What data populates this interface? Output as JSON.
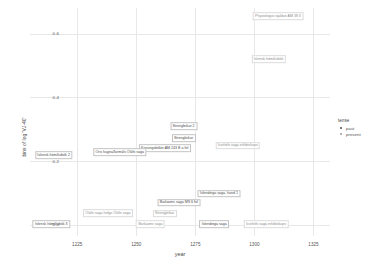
{
  "chart_data": {
    "type": "scatter",
    "title": "",
    "xlabel": "year",
    "ylabel": "bins of log 'VJ-40'",
    "xlim": [
      1205,
      1332
    ],
    "ylim": [
      -0.035,
      0.68
    ],
    "xticks": [
      1225,
      1250,
      1275,
      1300,
      1325
    ],
    "xtick_labels": [
      "1225",
      "1250",
      "1275",
      "1300",
      "1325"
    ],
    "yticks": [
      0.0,
      0.2,
      0.4,
      0.6
    ],
    "ytick_labels": [
      "0.0",
      "0.2",
      "0.4",
      "0.6"
    ],
    "grid": true,
    "legend": {
      "title": "tense",
      "position": "right",
      "entries": [
        {
          "label": "past",
          "color": "#4a4a4a",
          "marker": "circle"
        },
        {
          "label": "present",
          "color": "#9a9a9a",
          "marker": "circle"
        }
      ]
    },
    "points": [
      {
        "label": "Physiologus sjaldan AM 38 II",
        "x": 1310,
        "y": 0.655,
        "tense": "present"
      },
      {
        "label": "Íslensk hómilíubók",
        "x": 1306,
        "y": 0.52,
        "tense": "present"
      },
      {
        "label": "Strengleikar 2",
        "x": 1270,
        "y": 0.31,
        "tense": "past"
      },
      {
        "label": "Strengleikar",
        "x": 1270,
        "y": 0.272,
        "tense": "past"
      },
      {
        "label": "Konungsbókin AM 243 B a fol",
        "x": 1262,
        "y": 0.24,
        "tense": "past"
      },
      {
        "label": "Þorleifs saga erkibiskups",
        "x": 1293,
        "y": 0.248,
        "tense": "present"
      },
      {
        "label": "Oris hagnaðarmáls Óláfs saga",
        "x": 1243,
        "y": 0.228,
        "tense": "past"
      },
      {
        "label": "Íslensk hómilíubók 2",
        "x": 1215,
        "y": 0.218,
        "tense": "past"
      },
      {
        "label": "Íslendinga saga, hand 1",
        "x": 1285,
        "y": 0.098,
        "tense": "past"
      },
      {
        "label": "Barlaams saga MS 6 fol",
        "x": 1268,
        "y": 0.07,
        "tense": "past"
      },
      {
        "label": "Strengleikar",
        "x": 1262,
        "y": 0.035,
        "tense": "present"
      },
      {
        "label": "Óláfs saga helga Óláfs saga",
        "x": 1238,
        "y": 0.036,
        "tense": "present"
      },
      {
        "label": "Íslensk hómilíubók 3",
        "x": 1214,
        "y": 0.002,
        "tense": "past"
      },
      {
        "label": "Barlaams saga",
        "x": 1256,
        "y": 0.002,
        "tense": "present"
      },
      {
        "label": "Íslendinga saga",
        "x": 1283,
        "y": 0.002,
        "tense": "past"
      },
      {
        "label": "Þorleifs saga erkibiskups",
        "x": 1305,
        "y": 0.002,
        "tense": "present"
      }
    ]
  }
}
